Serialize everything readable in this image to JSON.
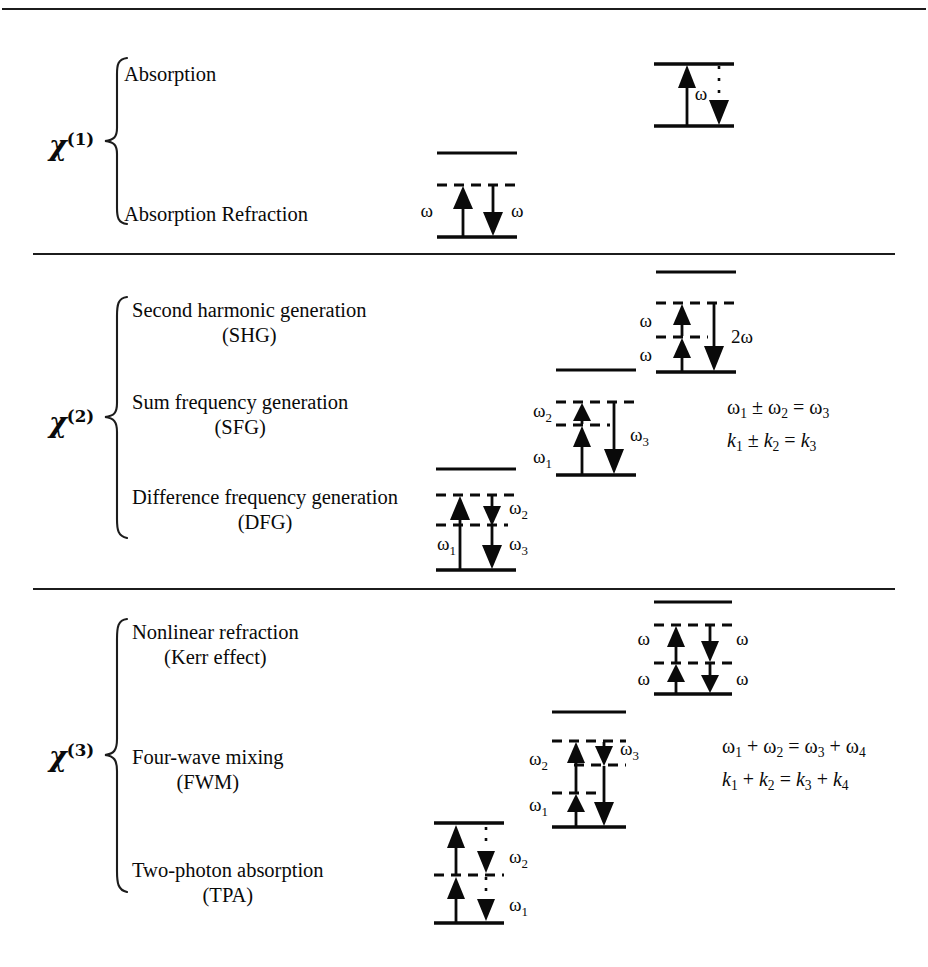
{
  "page": {
    "width": 928,
    "height": 967,
    "background": "#ffffff",
    "ink": "#1c1c1c",
    "top_rule": true
  },
  "sections": [
    {
      "id": "chi1",
      "order_symbol": "χ",
      "order_sup": "(1)",
      "processes": [
        {
          "line1": "Absorption",
          "line2": ""
        },
        {
          "line1": "Refraction",
          "line2": ""
        }
      ],
      "equations": [],
      "diagrams": [
        {
          "name": "absorption-diagram",
          "levels": [
            "solid-top",
            "solid-bottom"
          ],
          "arrows": [
            {
              "dir": "up",
              "label": "",
              "style": "solid"
            },
            {
              "dir": "down",
              "label": "ω",
              "style": "dotted-short"
            }
          ]
        },
        {
          "name": "refraction-diagram",
          "levels": [
            "solid-excited",
            "dashed-virtual",
            "solid-ground"
          ],
          "arrows": [
            {
              "dir": "up",
              "label": "ω",
              "style": "solid"
            },
            {
              "dir": "down",
              "label": "ω",
              "style": "solid"
            }
          ]
        }
      ]
    },
    {
      "id": "chi2",
      "order_symbol": "χ",
      "order_sup": "(2)",
      "processes": [
        {
          "line1": "Second harmonic generation",
          "line2": "(SHG)"
        },
        {
          "line1": "Sum frequency generation",
          "line2": "(SFG)"
        },
        {
          "line1": "Difference frequency generation",
          "line2": "(DFG)"
        }
      ],
      "equations": [
        {
          "lhs1": "ω",
          "sub1": "1",
          "op": "±",
          "lhs2": "ω",
          "sub2": "2",
          "rhs": "ω",
          "sub3": "3",
          "italic": false
        },
        {
          "lhs1": "k",
          "sub1": "1",
          "op": "±",
          "lhs2": "k",
          "sub2": "2",
          "rhs": "k",
          "sub3": "3",
          "italic": true
        }
      ],
      "diagrams": [
        {
          "name": "shg-diagram",
          "levels": [
            "solid-top",
            "dashed-upper",
            "dashed-lower",
            "solid-ground"
          ],
          "arrows": [
            {
              "dir": "up",
              "label": "ω",
              "style": "solid"
            },
            {
              "dir": "up",
              "label": "ω",
              "style": "solid"
            },
            {
              "dir": "down",
              "label": "2ω",
              "style": "solid"
            }
          ]
        },
        {
          "name": "sfg-diagram",
          "levels": [
            "solid-top",
            "dashed-upper",
            "dashed-lower",
            "solid-ground"
          ],
          "arrows": [
            {
              "dir": "up",
              "label": "ω₂",
              "style": "solid"
            },
            {
              "dir": "up",
              "label": "ω₁",
              "style": "solid"
            },
            {
              "dir": "down",
              "label": "ω₃",
              "style": "solid"
            }
          ]
        },
        {
          "name": "dfg-diagram",
          "levels": [
            "solid-top",
            "dashed-upper",
            "dashed-lower",
            "solid-ground"
          ],
          "arrows": [
            {
              "dir": "up",
              "label": "ω₁",
              "style": "solid"
            },
            {
              "dir": "down",
              "label": "ω₂",
              "style": "solid-short"
            },
            {
              "dir": "down",
              "label": "ω₃",
              "style": "solid"
            }
          ]
        }
      ]
    },
    {
      "id": "chi3",
      "order_symbol": "χ",
      "order_sup": "(3)",
      "processes": [
        {
          "line1": "Nonlinear refraction",
          "line2": "(Kerr effect)"
        },
        {
          "line1": "Four-wave mixing",
          "line2": "(FWM)"
        },
        {
          "line1": "Two-photon absorption",
          "line2": "(TPA)"
        }
      ],
      "equations": [
        {
          "lhs1": "ω",
          "sub1": "1",
          "op": "+",
          "lhs2": "ω",
          "sub2": "2",
          "rhs": "ω",
          "sub3": "3",
          "op2": "+",
          "rhs2": "ω",
          "sub4": "4",
          "italic": false
        },
        {
          "lhs1": "k",
          "sub1": "1",
          "op": "+",
          "lhs2": "k",
          "sub2": "2",
          "rhs": "k",
          "sub3": "3",
          "op2": "+",
          "rhs2": "k",
          "sub4": "4",
          "italic": true
        }
      ],
      "diagrams": [
        {
          "name": "kerr-diagram",
          "levels": [
            "solid-top",
            "dashed-upper",
            "dashed-lower",
            "solid-ground"
          ],
          "arrows": [
            {
              "dir": "up",
              "label": "ω",
              "style": "solid"
            },
            {
              "dir": "up",
              "label": "ω",
              "style": "solid"
            },
            {
              "dir": "down",
              "label": "ω",
              "style": "solid"
            },
            {
              "dir": "down",
              "label": "ω",
              "style": "solid"
            }
          ]
        },
        {
          "name": "fwm-diagram",
          "levels": [
            "solid-top",
            "dashed-upper",
            "dashed-mid",
            "dashed-lower",
            "solid-ground"
          ],
          "arrows": [
            {
              "dir": "up",
              "label": "ω₂",
              "style": "solid"
            },
            {
              "dir": "up",
              "label": "ω₁",
              "style": "solid"
            },
            {
              "dir": "down",
              "label": "ω₃",
              "style": "solid-short"
            },
            {
              "dir": "down",
              "label": "",
              "style": "solid"
            }
          ]
        },
        {
          "name": "tpa-diagram",
          "levels": [
            "solid-top",
            "dashed-mid",
            "solid-ground"
          ],
          "arrows": [
            {
              "dir": "up",
              "label": "",
              "style": "solid"
            },
            {
              "dir": "up",
              "label": "",
              "style": "solid"
            },
            {
              "dir": "down",
              "label": "ω₂",
              "style": "dotted-short"
            },
            {
              "dir": "down",
              "label": "ω₁",
              "style": "dotted-short"
            }
          ]
        }
      ]
    }
  ],
  "labels": {
    "omega": "ω",
    "omega1": "ω",
    "omega_sub1": "1",
    "omega_sub2": "2",
    "omega_sub3": "3",
    "two_omega": "2ω",
    "k": "k"
  },
  "rules": [
    {
      "name": "top-border",
      "y": 8,
      "x": 2,
      "w": 924
    },
    {
      "name": "divider-chi1-chi2",
      "y": 253,
      "x": 33,
      "w": 862
    },
    {
      "name": "divider-chi2-chi3",
      "y": 588,
      "x": 33,
      "w": 862
    }
  ]
}
